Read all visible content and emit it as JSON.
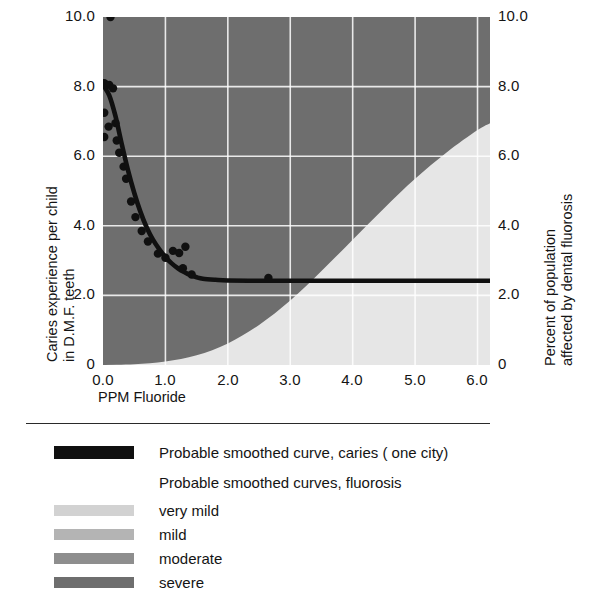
{
  "chart_data": {
    "type": "line",
    "title": "",
    "xlabel": "PPM Fluoride",
    "ylabel_left": "Caries experience per child in D.M.F. teeth",
    "ylabel_left_line1": "Caries experience per child",
    "ylabel_left_line2": "in D.M.F. teeth",
    "ylabel_right": "Percent of population affected by dental fluorosis",
    "ylabel_right_line1": "Percent of population",
    "ylabel_right_line2": "affected by dental fluorosis",
    "xlim": [
      0.0,
      6.2
    ],
    "ylim": [
      0.0,
      10.0
    ],
    "ylim_right": [
      0.0,
      10.0
    ],
    "grid": true,
    "grid_color": "#ffffff",
    "xticks": [
      "0.0",
      "1.0",
      "2.0",
      "3.0",
      "4.0",
      "5.0",
      "6.0"
    ],
    "xtick_values": [
      0.0,
      1.0,
      2.0,
      3.0,
      4.0,
      5.0,
      6.0
    ],
    "yticks_left": [
      "0",
      "2.0",
      "4.0",
      "6.0",
      "8.0",
      "10.0"
    ],
    "ytick_values_left": [
      0.0,
      2.0,
      4.0,
      6.0,
      8.0,
      10.0
    ],
    "yticks_right": [
      "0",
      "2.0",
      "4.0",
      "6.0",
      "8.0",
      "10.0"
    ],
    "ytick_values_right": [
      0.0,
      2.0,
      4.0,
      6.0,
      8.0,
      10.0
    ],
    "legend_position": "below-plot",
    "series": [
      {
        "name": "Probable smoothed curve, caries ( one city)",
        "type": "line",
        "color": "#101010",
        "axis": "left",
        "x": [
          0.0,
          0.1,
          0.2,
          0.3,
          0.4,
          0.5,
          0.6,
          0.7,
          0.8,
          0.9,
          1.0,
          1.1,
          1.2,
          1.3,
          1.4,
          1.5,
          1.6,
          1.8,
          2.0,
          2.5,
          3.0,
          3.5,
          4.0,
          4.5,
          5.0,
          5.5,
          6.0,
          6.2
        ],
        "values": [
          8.05,
          7.75,
          7.15,
          6.35,
          5.6,
          4.95,
          4.4,
          3.95,
          3.6,
          3.33,
          3.1,
          2.92,
          2.78,
          2.67,
          2.58,
          2.52,
          2.48,
          2.45,
          2.43,
          2.42,
          2.42,
          2.42,
          2.42,
          2.42,
          2.42,
          2.42,
          2.42,
          2.42
        ]
      },
      {
        "name": "very mild",
        "type": "area",
        "color": "#d2d2d2",
        "axis": "right",
        "x": [
          0.0,
          0.5,
          1.0,
          1.5,
          2.0,
          2.5,
          3.0,
          3.5,
          4.0,
          4.5,
          5.0,
          5.5,
          6.0,
          6.2
        ],
        "values": [
          0.05,
          0.55,
          1.5,
          2.8,
          4.4,
          6.0,
          7.35,
          8.35,
          9.05,
          9.45,
          9.7,
          9.85,
          9.95,
          10.0
        ]
      },
      {
        "name": "mild",
        "type": "area",
        "color": "#a8a8a8",
        "axis": "right",
        "x": [
          0.0,
          0.5,
          1.0,
          1.5,
          2.0,
          2.5,
          3.0,
          3.5,
          4.0,
          4.5,
          5.0,
          5.5,
          6.0,
          6.2
        ],
        "values": [
          0.02,
          0.22,
          0.72,
          1.6,
          2.85,
          4.3,
          5.7,
          6.9,
          7.85,
          8.55,
          9.05,
          9.4,
          9.6,
          9.68
        ]
      },
      {
        "name": "moderate",
        "type": "area",
        "color": "#8a8a8a",
        "axis": "right",
        "x": [
          0.0,
          0.5,
          1.0,
          1.5,
          2.0,
          2.5,
          3.0,
          3.5,
          4.0,
          4.5,
          5.0,
          5.5,
          6.0,
          6.2
        ],
        "values": [
          0.0,
          0.08,
          0.3,
          0.75,
          1.45,
          2.4,
          3.5,
          4.65,
          5.75,
          6.7,
          7.5,
          8.15,
          8.65,
          8.8
        ]
      },
      {
        "name": "severe",
        "type": "area",
        "color": "#6e6e6e",
        "axis": "right",
        "x": [
          0.0,
          0.5,
          1.0,
          1.5,
          2.0,
          2.5,
          3.0,
          3.5,
          4.0,
          4.5,
          5.0,
          5.5,
          6.0,
          6.2
        ],
        "values": [
          0.0,
          0.02,
          0.1,
          0.28,
          0.62,
          1.15,
          1.85,
          2.7,
          3.6,
          4.5,
          5.35,
          6.1,
          6.75,
          6.95
        ]
      }
    ],
    "scatter": {
      "name": "caries observations",
      "color": "#101010",
      "marker": "circle",
      "points": [
        [
          0.12,
          10.0
        ],
        [
          0.02,
          8.1
        ],
        [
          0.1,
          8.05
        ],
        [
          0.16,
          7.95
        ],
        [
          0.02,
          7.25
        ],
        [
          0.09,
          6.85
        ],
        [
          0.02,
          6.55
        ],
        [
          0.2,
          6.95
        ],
        [
          0.22,
          6.45
        ],
        [
          0.26,
          6.1
        ],
        [
          0.33,
          5.7
        ],
        [
          0.37,
          5.35
        ],
        [
          0.45,
          4.7
        ],
        [
          0.52,
          4.25
        ],
        [
          0.62,
          3.85
        ],
        [
          0.72,
          3.55
        ],
        [
          0.88,
          3.2
        ],
        [
          1.0,
          3.08
        ],
        [
          1.12,
          3.28
        ],
        [
          1.22,
          3.22
        ],
        [
          1.32,
          3.4
        ],
        [
          1.28,
          2.78
        ],
        [
          1.42,
          2.6
        ],
        [
          2.65,
          2.5
        ]
      ]
    }
  },
  "legend": {
    "items": [
      {
        "label": "Probable smoothed curve, caries ( one city)",
        "swatch": "curve",
        "color": "#101010"
      },
      {
        "label": "Probable smoothed curves, fluorosis",
        "swatch": "none",
        "color": ""
      },
      {
        "label": "very mild",
        "swatch": "band",
        "color": "#d2d2d2"
      },
      {
        "label": "mild",
        "swatch": "band",
        "color": "#b4b4b4"
      },
      {
        "label": "moderate",
        "swatch": "band",
        "color": "#8e8e8e"
      },
      {
        "label": "severe",
        "swatch": "band",
        "color": "#6e6e6e"
      }
    ]
  }
}
